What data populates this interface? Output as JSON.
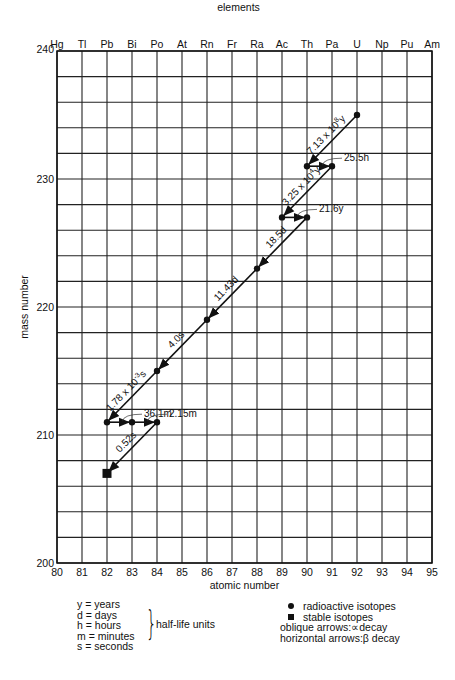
{
  "chart_data": {
    "type": "scatter",
    "title": "",
    "top_axis_label": "elements",
    "xlabel": "atomic number",
    "ylabel": "mass number",
    "xlim": [
      80,
      95
    ],
    "ylim": [
      200,
      240
    ],
    "x_ticks": [
      80,
      81,
      82,
      83,
      84,
      85,
      86,
      87,
      88,
      89,
      90,
      91,
      92,
      93,
      94,
      95
    ],
    "y_ticks": [
      200,
      210,
      220,
      230,
      240
    ],
    "grid": {
      "x_step": 1,
      "y_step": 2
    },
    "elements": [
      "Hg",
      "Tl",
      "Pb",
      "Bi",
      "Po",
      "At",
      "Rn",
      "Fr",
      "Ra",
      "Ac",
      "Th",
      "Pa",
      "U",
      "Np",
      "Pu",
      "Am"
    ],
    "isotopes": [
      {
        "z": 92,
        "a": 235,
        "kind": "radioactive"
      },
      {
        "z": 90,
        "a": 231,
        "kind": "radioactive"
      },
      {
        "z": 91,
        "a": 231,
        "kind": "radioactive"
      },
      {
        "z": 89,
        "a": 227,
        "kind": "radioactive"
      },
      {
        "z": 90,
        "a": 227,
        "kind": "radioactive"
      },
      {
        "z": 88,
        "a": 223,
        "kind": "radioactive"
      },
      {
        "z": 86,
        "a": 219,
        "kind": "radioactive"
      },
      {
        "z": 84,
        "a": 215,
        "kind": "radioactive"
      },
      {
        "z": 82,
        "a": 211,
        "kind": "radioactive"
      },
      {
        "z": 83,
        "a": 211,
        "kind": "radioactive"
      },
      {
        "z": 84,
        "a": 211,
        "kind": "radioactive"
      },
      {
        "z": 82,
        "a": 207,
        "kind": "stable"
      }
    ],
    "decays": [
      {
        "from": [
          92,
          235
        ],
        "to": [
          90,
          231
        ],
        "type": "alpha",
        "half_life": "7.13 x 10",
        "exp": "8",
        "unit": "y"
      },
      {
        "from": [
          90,
          231
        ],
        "to": [
          91,
          231
        ],
        "type": "beta",
        "half_life": "25.5h"
      },
      {
        "from": [
          91,
          231
        ],
        "to": [
          89,
          227
        ],
        "type": "alpha",
        "half_life": "3.25 x 10",
        "exp": "4",
        "unit": "y"
      },
      {
        "from": [
          89,
          227
        ],
        "to": [
          90,
          227
        ],
        "type": "beta",
        "half_life": "21.6y"
      },
      {
        "from": [
          90,
          227
        ],
        "to": [
          88,
          223
        ],
        "type": "alpha",
        "half_life": "18.5d"
      },
      {
        "from": [
          88,
          223
        ],
        "to": [
          86,
          219
        ],
        "type": "alpha",
        "half_life": "11.43d"
      },
      {
        "from": [
          86,
          219
        ],
        "to": [
          84,
          215
        ],
        "type": "alpha",
        "half_life": "4.0s"
      },
      {
        "from": [
          84,
          215
        ],
        "to": [
          82,
          211
        ],
        "type": "alpha",
        "half_life": "1.78 x 10",
        "exp": "-3",
        "unit": "s"
      },
      {
        "from": [
          82,
          211
        ],
        "to": [
          83,
          211
        ],
        "type": "beta",
        "half_life": "36.1m"
      },
      {
        "from": [
          83,
          211
        ],
        "to": [
          84,
          211
        ],
        "type": "beta",
        "half_life": "2.15m"
      },
      {
        "from": [
          84,
          211
        ],
        "to": [
          82,
          207
        ],
        "type": "alpha",
        "half_life": "0.52s"
      }
    ]
  },
  "legend": {
    "units": [
      {
        "abbr": "y",
        "name": "years"
      },
      {
        "abbr": "d",
        "name": "days"
      },
      {
        "abbr": "h",
        "name": "hours"
      },
      {
        "abbr": "m",
        "name": "minutes"
      },
      {
        "abbr": "s",
        "name": "seconds"
      }
    ],
    "units_group_label": "half-life units",
    "radioactive_label": "radioactive isotopes",
    "stable_label": "stable isotopes",
    "oblique_label": "oblique arrows:∝decay",
    "horizontal_label": "horizontal arrows:β decay"
  }
}
